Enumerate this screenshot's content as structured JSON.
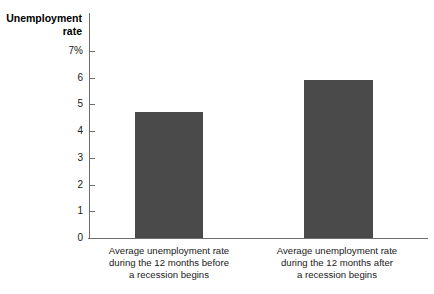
{
  "chart_data": {
    "type": "bar",
    "title": "",
    "ylabel": "Unemployment rate",
    "xlabel": "",
    "ylim": [
      0,
      7
    ],
    "grid": false,
    "legend": false,
    "categories": [
      "Average unemployment rate during the 12 months before a recession begins",
      "Average unemployment rate during the 12 months after a recession begins"
    ],
    "values": [
      4.7,
      5.9
    ],
    "tick_labels": [
      "7%",
      "6",
      "5",
      "4",
      "3",
      "2",
      "1",
      "0"
    ],
    "tick_values": [
      7,
      6,
      5,
      4,
      3,
      2,
      1,
      0
    ],
    "bar_color": "#4a4a4a",
    "axis_color": "#6d6d6d",
    "background": "#ffffff"
  },
  "axis": {
    "title_line1": "Unemployment",
    "title_line2": "rate"
  },
  "ticks": [
    {
      "label": "7%",
      "value": 7
    },
    {
      "label": "6",
      "value": 6
    },
    {
      "label": "5",
      "value": 5
    },
    {
      "label": "4",
      "value": 4
    },
    {
      "label": "3",
      "value": 3
    },
    {
      "label": "2",
      "value": 2
    },
    {
      "label": "1",
      "value": 1
    },
    {
      "label": "0",
      "value": 0
    }
  ],
  "bars": [
    {
      "value": 4.7,
      "caption_line1": "Average unemployment rate",
      "caption_line2": "during the 12 months before",
      "caption_line3": "a recession begins"
    },
    {
      "value": 5.9,
      "caption_line1": "Average unemployment rate",
      "caption_line2": "during the 12 months after",
      "caption_line3": "a recession begins"
    }
  ]
}
